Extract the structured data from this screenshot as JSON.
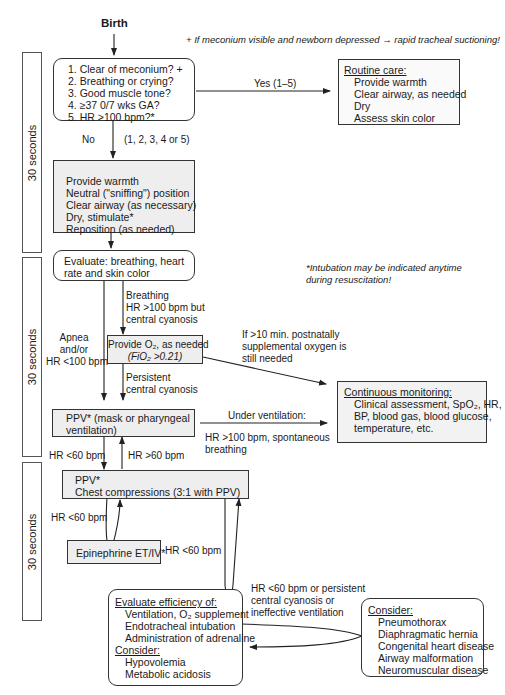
{
  "start": {
    "label": "Birth"
  },
  "notes": {
    "meconium": "+ If meconium visible and newborn depressed → rapid tracheal suctioning!",
    "intubation": [
      "*Intubation may be indicated anytime",
      "during resuscitation!"
    ]
  },
  "time_bars": [
    {
      "label": "30 seconds"
    },
    {
      "label": "30 seconds"
    },
    {
      "label": "30 seconds"
    }
  ],
  "boxes": {
    "initial_questions": {
      "lines": [
        "1. Clear of meconium? +",
        "2. Breathing or crying?",
        "3. Good muscle tone?",
        "4. ≥37 0/7 wks GA?",
        "5. HR >100 bpm?*"
      ]
    },
    "routine_care": {
      "title": "Routine care:",
      "lines": [
        "Provide warmth",
        "Clear airway, as needed",
        "Dry",
        "Assess skin color"
      ]
    },
    "initial_steps": {
      "lines": [
        "Provide warmth",
        "Neutral (\"sniffing\") position",
        "Clear airway  (as necessary)",
        "Dry, stimulate*",
        "Reposition (as needed)"
      ]
    },
    "evaluate": {
      "lines": [
        "Evaluate: breathing, heart",
        "rate and skin color"
      ]
    },
    "oxygen": {
      "lines": [
        "Provide O₂, as needed",
        "(FiO₂ >0.21)"
      ]
    },
    "ppv": {
      "lines": [
        "PPV* (mask or pharyngeal",
        "ventilation)"
      ]
    },
    "compressions": {
      "lines": [
        "PPV*",
        "Chest compressions (3:1 with PPV)"
      ]
    },
    "epinephrine": {
      "label": "Epinephrine ET/IV*"
    },
    "continuous_monitoring": {
      "title": "Continuous monitoring:",
      "lines": [
        "Clinical assessment, SpO₂, HR,",
        "BP, blood gas, blood glucose,",
        "temperature, etc."
      ]
    },
    "evaluate_efficiency": {
      "title": "Evaluate efficiency of:",
      "lines": [
        "Ventilation, O₂ supplement",
        "Endotracheal intubation",
        "Administration of adrenaline"
      ],
      "consider_title": "Consider:",
      "consider_lines": [
        "Hypovolemia",
        "Metabolic acidosis"
      ]
    },
    "consider": {
      "title": "Consider:",
      "lines": [
        "Pneumothorax",
        "Diaphragmatic hernia",
        "Congenital heart disease",
        "Airway malformation",
        "Neuromuscular disease"
      ]
    }
  },
  "edge_labels": {
    "yes": "Yes (1–5)",
    "no": "No",
    "no_conditions": "(1, 2, 3, 4 or 5)",
    "breathing": [
      "Breathing",
      "HR >100 bpm but",
      "central cyanosis"
    ],
    "apnea": [
      "Apnea",
      "and/or",
      "HR <100 bpm"
    ],
    "persistent_cyanosis": [
      "Persistent",
      "central cyanosis"
    ],
    "supplemental_oxygen": [
      "If >10 min. postnatally",
      "supplemental oxygen is",
      "still needed"
    ],
    "under_ventilation": "Under ventilation:",
    "hr_over_100_spontaneous": [
      "HR >100 bpm, spontaneous",
      "breathing"
    ],
    "hr_under_60_a": "HR <60 bpm",
    "hr_over_60": "HR >60 bpm",
    "hr_under_60_b": "HR <60 bpm",
    "hr_under_60_c": "HR <60 bpm",
    "hr_under_60_persistent": [
      "HR <60 bpm or persistent",
      "central cyanosis or",
      "ineffective ventilation"
    ]
  }
}
